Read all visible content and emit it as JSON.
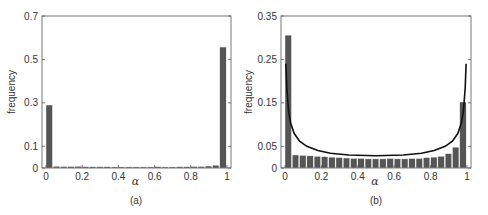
{
  "chart_data": [
    {
      "type": "bar",
      "panel_label": "(a)",
      "xlabel": "α",
      "ylabel": "frequency",
      "xlim": [
        0,
        1
      ],
      "ylim": [
        0,
        0.7
      ],
      "xticks": [
        0,
        0.2,
        0.4,
        0.6,
        0.8,
        1
      ],
      "xtick_labels": [
        "0",
        "0.2",
        "0.4",
        "0.6",
        "0.8",
        "1"
      ],
      "yticks": [
        0,
        0.1,
        0.3,
        0.5,
        0.7
      ],
      "ytick_labels": [
        "0",
        "0.1",
        "0.3",
        "0.5",
        "0.7"
      ],
      "bin_width": 0.04,
      "bins": [
        0.02,
        0.06,
        0.1,
        0.14,
        0.18,
        0.22,
        0.26,
        0.3,
        0.34,
        0.38,
        0.42,
        0.46,
        0.5,
        0.54,
        0.58,
        0.62,
        0.66,
        0.7,
        0.74,
        0.78,
        0.82,
        0.86,
        0.9,
        0.94,
        0.98
      ],
      "values": [
        0.29,
        0.008,
        0.007,
        0.007,
        0.008,
        0.006,
        0.006,
        0.006,
        0.006,
        0.005,
        0.005,
        0.005,
        0.005,
        0.005,
        0.005,
        0.006,
        0.005,
        0.005,
        0.006,
        0.006,
        0.007,
        0.007,
        0.009,
        0.013,
        0.557
      ],
      "bar_color": "#555555"
    },
    {
      "type": "bar",
      "panel_label": "(b)",
      "xlabel": "α",
      "ylabel": "frequency",
      "xlim": [
        0,
        1
      ],
      "ylim": [
        0,
        0.35
      ],
      "xticks": [
        0,
        0.2,
        0.4,
        0.6,
        0.8,
        1
      ],
      "xtick_labels": [
        "0",
        "0.2",
        "0.4",
        "0.6",
        "0.8",
        "1"
      ],
      "yticks": [
        0,
        0.05,
        0.15,
        0.25,
        0.35
      ],
      "ytick_labels": [
        "0",
        "0.05",
        "0.15",
        "0.25",
        "0.35"
      ],
      "bin_width": 0.04,
      "bins": [
        0.02,
        0.06,
        0.1,
        0.14,
        0.18,
        0.22,
        0.26,
        0.3,
        0.34,
        0.38,
        0.42,
        0.46,
        0.5,
        0.54,
        0.58,
        0.62,
        0.66,
        0.7,
        0.74,
        0.78,
        0.82,
        0.86,
        0.9,
        0.94,
        0.98
      ],
      "values": [
        0.306,
        0.03,
        0.029,
        0.028,
        0.027,
        0.026,
        0.025,
        0.024,
        0.023,
        0.022,
        0.022,
        0.021,
        0.021,
        0.021,
        0.022,
        0.021,
        0.021,
        0.022,
        0.022,
        0.024,
        0.025,
        0.027,
        0.033,
        0.048,
        0.152
      ],
      "bar_color": "#555555",
      "overlay_curve": {
        "type": "line",
        "description": "fitted U-shaped density curve",
        "x": [
          0.005,
          0.01,
          0.02,
          0.03,
          0.05,
          0.08,
          0.12,
          0.18,
          0.25,
          0.35,
          0.5,
          0.65,
          0.75,
          0.82,
          0.88,
          0.92,
          0.95,
          0.97,
          0.98,
          0.99,
          0.995
        ],
        "y": [
          0.24,
          0.185,
          0.13,
          0.105,
          0.08,
          0.062,
          0.05,
          0.04,
          0.034,
          0.03,
          0.028,
          0.03,
          0.034,
          0.04,
          0.05,
          0.062,
          0.08,
          0.105,
          0.13,
          0.185,
          0.24
        ],
        "color": "#111111"
      }
    }
  ]
}
